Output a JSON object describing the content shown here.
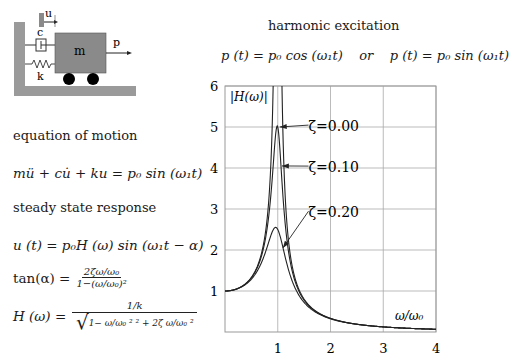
{
  "diagram": {
    "mass_label": "m",
    "damper_label": "c",
    "spring_label": "k",
    "displacement_label": "u",
    "force_label": "p",
    "colors": {
      "mass": "#8a8a8a",
      "wall": "#9a9a9a",
      "wheel": "#000000"
    }
  },
  "left": {
    "eom_heading": "equation of motion",
    "eom": "mü + cu̇ + ku = p₀ sin (ω₁t)",
    "ss_heading": "steady state response",
    "response": "u (t) = p₀H (ω) sin (ω₁t − α)",
    "tan_lhs": "tan(α) =",
    "tan_num": "2ζω/ω₀",
    "tan_den": "1−(ω/ω₀)²",
    "h_lhs": "H (ω) =",
    "h_num": "1/k",
    "h_den": "1−  ω/ω₀  ²  ²  +  2ζ ω/ω₀  ²"
  },
  "right": {
    "title": "harmonic excitation",
    "excitation": "p (t) = p₀ cos (ω₁t)    or    p (t) = p₀ sin (ω₁t)"
  },
  "chart_data": {
    "type": "line",
    "title": "|H(ω)|",
    "xlabel": "ω/ω₀",
    "ylabel": "|H(ω)|",
    "xlim": [
      0,
      4
    ],
    "ylim": [
      0,
      6
    ],
    "xticks": [
      "1",
      "2",
      "3",
      "4"
    ],
    "yticks": [
      "1",
      "2",
      "3",
      "4",
      "5",
      "6"
    ],
    "grid": true,
    "series": [
      {
        "name": "ζ=0.00",
        "zeta": 0.0,
        "peak": "unbounded at ω/ω₀=1"
      },
      {
        "name": "ζ=0.10",
        "zeta": 0.1,
        "peak": 5.0
      },
      {
        "name": "ζ=0.20",
        "zeta": 0.2,
        "peak": 2.5
      }
    ],
    "annotations": [
      {
        "text": "ζ=0.00",
        "x": 2.0,
        "y": 4.9
      },
      {
        "text": "ζ=0.10",
        "x": 2.0,
        "y": 3.9
      },
      {
        "text": "ζ=0.20",
        "x": 2.0,
        "y": 2.8
      }
    ]
  }
}
